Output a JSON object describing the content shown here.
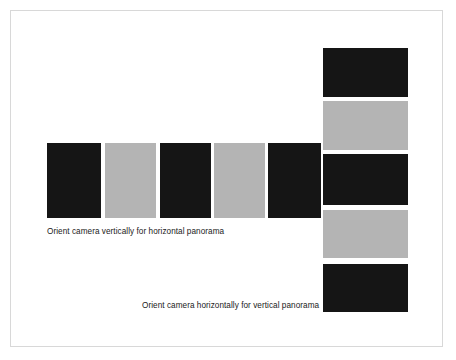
{
  "figure": {
    "background_color": "#ffffff",
    "frame_color": "#d8d8d8",
    "dark_color": "#151515",
    "light_color": "#b4b4b4",
    "text_color": "#1a1a1a"
  },
  "captions": {
    "horizontal_panorama": "Orient camera vertically for horizontal panorama",
    "vertical_panorama": "Orient camera horizontally for vertical panorama"
  },
  "horizontal_strip": {
    "label": "horizontal-panorama-frame-strip",
    "orientation": "portrait-frames-in-a-row",
    "frames": [
      {
        "index": 1,
        "color": "#151515",
        "x": 47,
        "y": 143,
        "width": 54,
        "height": 75
      },
      {
        "index": 2,
        "color": "#b4b4b4",
        "x": 105,
        "y": 143,
        "width": 51,
        "height": 75
      },
      {
        "index": 3,
        "color": "#151515",
        "x": 160,
        "y": 143,
        "width": 51,
        "height": 75
      },
      {
        "index": 4,
        "color": "#b4b4b4",
        "x": 214,
        "y": 143,
        "width": 51,
        "height": 75
      },
      {
        "index": 5,
        "color": "#151515",
        "x": 268,
        "y": 143,
        "width": 53,
        "height": 75
      }
    ]
  },
  "vertical_strip": {
    "label": "vertical-panorama-frame-strip",
    "orientation": "landscape-frames-in-a-column",
    "frames": [
      {
        "index": 1,
        "color": "#151515",
        "x": 323,
        "y": 48,
        "width": 85,
        "height": 49
      },
      {
        "index": 2,
        "color": "#b4b4b4",
        "x": 323,
        "y": 101,
        "width": 85,
        "height": 49
      },
      {
        "index": 3,
        "color": "#151515",
        "x": 323,
        "y": 154,
        "width": 85,
        "height": 51
      },
      {
        "index": 4,
        "color": "#b4b4b4",
        "x": 323,
        "y": 210,
        "width": 85,
        "height": 48
      },
      {
        "index": 5,
        "color": "#151515",
        "x": 323,
        "y": 264,
        "width": 85,
        "height": 48
      }
    ]
  }
}
